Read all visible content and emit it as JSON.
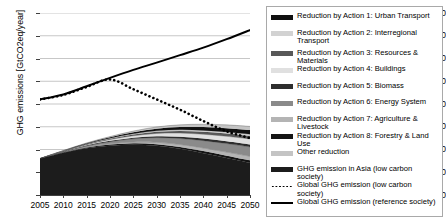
{
  "chart_data": {
    "type": "area",
    "title": "",
    "xlabel": "",
    "ylabel": "GHG emissions [GtCO2eq/year]",
    "xlim": [
      2005,
      2050
    ],
    "ylim": [
      0,
      80
    ],
    "grid": true,
    "legend_position": "right",
    "x_ticks": [
      "2005",
      "2010",
      "2015",
      "2020",
      "2025",
      "2030",
      "2035",
      "2040",
      "2045",
      "2050"
    ],
    "y_ticks": [
      "0",
      "10",
      "20",
      "30",
      "40",
      "50",
      "60",
      "70",
      "80"
    ],
    "x": [
      2005,
      2010,
      2015,
      2020,
      2025,
      2030,
      2035,
      2040,
      2045,
      2050
    ],
    "stacked_series": [
      {
        "name": "GHG emission in Asia (low carbon society)",
        "color": "#1c1c1c",
        "values": [
          16.0,
          18.6,
          20.6,
          21.7,
          22.1,
          21.6,
          20.3,
          18.4,
          16.3,
          14.2
        ]
      },
      {
        "name": "Reduction by Action 8: Forestry & Land Use",
        "color": "#141414",
        "values": [
          0.0,
          0.15,
          0.3,
          0.45,
          0.6,
          0.75,
          0.85,
          0.95,
          1.0,
          1.05
        ]
      },
      {
        "name": "Reduction by Action 7: Agriculture & Livestock",
        "color": "#b4b4b4",
        "values": [
          0.0,
          0.1,
          0.25,
          0.4,
          0.6,
          0.85,
          1.1,
          1.35,
          1.6,
          1.8
        ]
      },
      {
        "name": "Reduction by Action 6: Energy System",
        "color": "#8a8a8a",
        "values": [
          0.0,
          0.2,
          0.5,
          0.9,
          1.4,
          2.0,
          2.6,
          3.2,
          3.7,
          4.1
        ]
      },
      {
        "name": "Reduction by Action 5: Biomass",
        "color": "#2e2e2e",
        "values": [
          0.0,
          0.08,
          0.2,
          0.35,
          0.5,
          0.65,
          0.8,
          0.9,
          1.0,
          1.05
        ]
      },
      {
        "name": "Reduction by Action 4: Buildings",
        "color": "#e0e0e0",
        "values": [
          0.0,
          0.12,
          0.3,
          0.55,
          0.85,
          1.2,
          1.55,
          1.9,
          2.2,
          2.45
        ]
      },
      {
        "name": "Reduction by Action 3: Resources & Materials",
        "color": "#585858",
        "values": [
          0.0,
          0.1,
          0.22,
          0.38,
          0.55,
          0.75,
          0.95,
          1.1,
          1.25,
          1.35
        ]
      },
      {
        "name": "Reduction by Action 2: Interregional Transport",
        "color": "#d2d2d2",
        "values": [
          0.0,
          0.05,
          0.12,
          0.2,
          0.3,
          0.4,
          0.5,
          0.6,
          0.68,
          0.75
        ]
      },
      {
        "name": "Reduction by Action 1: Urban Transport",
        "color": "#101010",
        "values": [
          0.0,
          0.1,
          0.25,
          0.45,
          0.7,
          0.95,
          1.2,
          1.45,
          1.65,
          1.8
        ]
      },
      {
        "name": "Other reduction",
        "color": "#c4c4c4",
        "values": [
          0.0,
          0.05,
          0.15,
          0.3,
          0.5,
          0.75,
          1.0,
          1.25,
          1.45,
          1.6
        ]
      }
    ],
    "lines": [
      {
        "name": "Global GHG emission (low carbon society)",
        "style": "dotted",
        "color": "#000000",
        "values": [
          42.0,
          44.0,
          47.5,
          50.8,
          46.5,
          42.0,
          37.5,
          32.5,
          28.0,
          25.0
        ]
      },
      {
        "name": "Global GHG emission (reference society)",
        "style": "solid",
        "color": "#000000",
        "values": [
          42.0,
          44.2,
          47.8,
          51.5,
          55.0,
          58.2,
          61.5,
          64.8,
          68.5,
          72.5
        ]
      }
    ]
  },
  "axes": {
    "y_title": "GHG emissions [GtCO2eq/year]",
    "y_ticks": [
      "80",
      "70",
      "60",
      "50",
      "40",
      "30",
      "20",
      "10",
      "0"
    ],
    "x_ticks": [
      "2005",
      "2010",
      "2015",
      "2020",
      "2025",
      "2030",
      "2035",
      "2040",
      "2045",
      "2050"
    ]
  },
  "legend": {
    "items": [
      {
        "label": "Reduction by Action 1: Urban Transport",
        "color": "#101010",
        "kind": "swatch"
      },
      {
        "label": "Reduction by Action 2: Interregional\nTransport",
        "color": "#d2d2d2",
        "kind": "swatch",
        "two_line": true
      },
      {
        "label": "Reduction by Action 3: Resources & Materials",
        "color": "#585858",
        "kind": "swatch"
      },
      {
        "label": "Reduction by Action 4: Buildings",
        "color": "#e0e0e0",
        "kind": "swatch"
      },
      {
        "label": "Reduction by Action 5: Biomass",
        "color": "#2e2e2e",
        "kind": "swatch"
      },
      {
        "label": "Reduction by Action 6: Energy System",
        "color": "#8a8a8a",
        "kind": "swatch"
      },
      {
        "label": "Reduction by Action 7: Agriculture & Livestock",
        "color": "#b4b4b4",
        "kind": "swatch"
      },
      {
        "label": "Reduction by Action 8: Forestry & Land Use",
        "color": "#141414",
        "kind": "swatch"
      },
      {
        "label": "Other reduction",
        "color": "#c4c4c4",
        "kind": "swatch"
      },
      {
        "label": "GHG emission in Asia (low carbon society)",
        "color": "#1c1c1c",
        "kind": "swatch"
      },
      {
        "label": "Global GHG emission (low carbon society)",
        "color": "#000000",
        "kind": "line-dotted"
      },
      {
        "label": "Global GHG emission (reference society)",
        "color": "#000000",
        "kind": "line-solid"
      }
    ]
  },
  "colors": {
    "grid": "#b9b9b9",
    "axis": "#3f3f3f",
    "background": "#ffffff",
    "legend_border": "#a9a9a9"
  }
}
